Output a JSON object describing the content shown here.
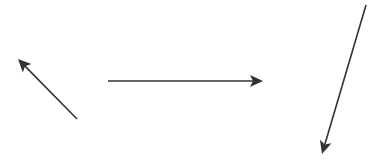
{
  "canvas": {
    "width": 383,
    "height": 160,
    "background": "#ffffff"
  },
  "style": {
    "stroke": "#333333",
    "stroke_width": 1.6
  },
  "arrows": [
    {
      "id": "arrow-up-left",
      "x1": 77,
      "y1": 119,
      "x2": 18,
      "y2": 59
    },
    {
      "id": "arrow-right",
      "x1": 108,
      "y1": 81,
      "x2": 263,
      "y2": 81
    },
    {
      "id": "arrow-down-left",
      "x1": 366,
      "y1": 5,
      "x2": 322,
      "y2": 154
    }
  ]
}
